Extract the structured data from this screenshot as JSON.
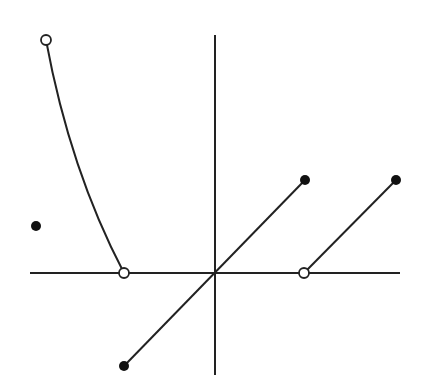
{
  "diagram": {
    "type": "piecewise-function-graph",
    "colors": {
      "background": "#ffffff",
      "stroke": "#222222",
      "open_fill": "#ffffff"
    },
    "axes": {
      "x_axis": {
        "x1": 30,
        "x2": 400,
        "y": 273
      },
      "y_axis": {
        "x": 215,
        "y1": 35,
        "y2": 375
      },
      "labels": []
    },
    "pieces": [
      {
        "name": "left-curve",
        "kind": "curve",
        "from": [
          -1.87,
          2.5
        ],
        "to": [
          -1,
          0
        ],
        "start_point": "open",
        "end_point": "open"
      },
      {
        "name": "isolated-point",
        "kind": "point",
        "at": [
          -2,
          0.5
        ],
        "point": "closed"
      },
      {
        "name": "middle-line",
        "kind": "segment",
        "from": [
          -1,
          -1
        ],
        "to": [
          1,
          1
        ],
        "start_point": "closed",
        "end_point": "closed"
      },
      {
        "name": "right-line",
        "kind": "segment",
        "from": [
          1,
          0
        ],
        "to": [
          2,
          1
        ],
        "start_point": "open",
        "end_point": "closed"
      }
    ]
  }
}
